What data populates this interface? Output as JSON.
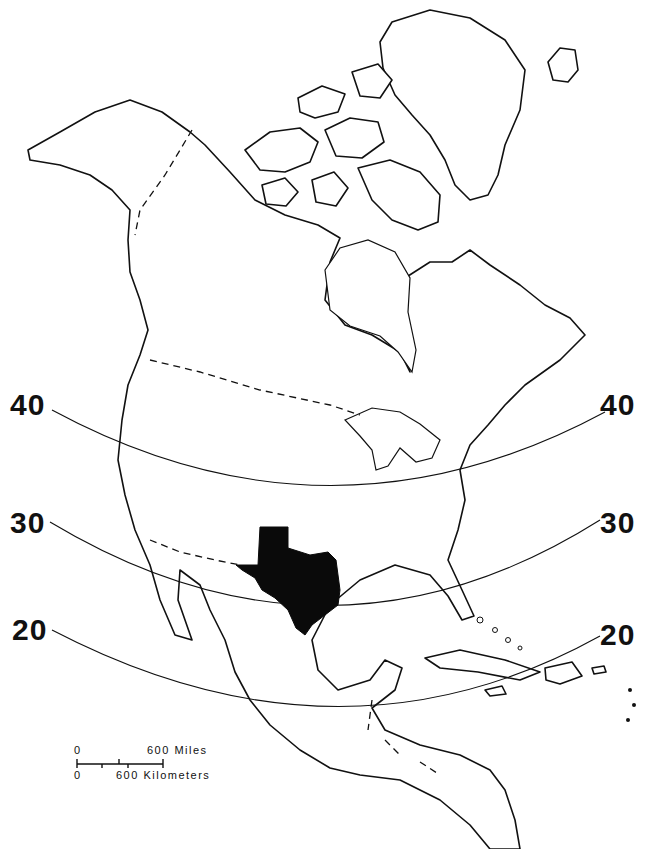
{
  "map": {
    "subject": "North America outline map",
    "highlighted_region": {
      "name": "Texas",
      "fill_color": "#0a0a0a"
    },
    "line_color": "#111111",
    "background_color": "#ffffff"
  },
  "latitude_lines": [
    {
      "value": "40",
      "left_label": "40",
      "right_label": "40"
    },
    {
      "value": "30",
      "left_label": "30",
      "right_label": "30"
    },
    {
      "value": "20",
      "left_label": "20",
      "right_label": "20"
    }
  ],
  "scale_bar": {
    "miles_zero": "0",
    "miles_label": "600 Miles",
    "km_zero": "0",
    "km_label": "600 Kilometers"
  }
}
